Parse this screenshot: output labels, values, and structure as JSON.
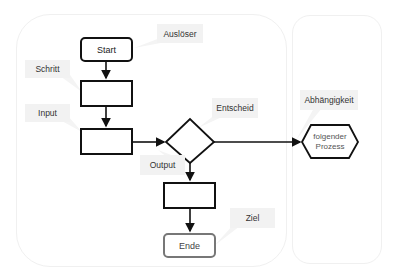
{
  "colors": {
    "stroke": "#111111",
    "end_stroke": "#777777",
    "callout_bg": "#f2f2f2",
    "lane_border": "#f0f0f0"
  },
  "nodes": {
    "start": "Start",
    "step1": "",
    "step2": "",
    "decision": "",
    "step3": "",
    "end": "Ende",
    "next_process": "folgender Prozess"
  },
  "callouts": {
    "trigger": "Auslöser",
    "step": "Schritt",
    "input": "Input",
    "decision": "Entscheid",
    "output": "Output",
    "goal": "Ziel",
    "dependency": "Abhängigkeit"
  }
}
